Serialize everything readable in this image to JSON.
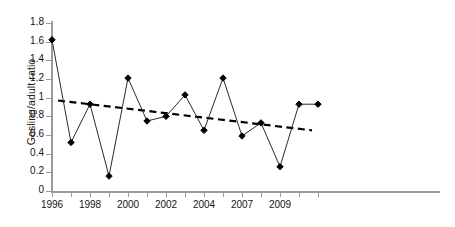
{
  "chart_data": {
    "type": "line",
    "title": "",
    "xlabel": "",
    "ylabel": "Gosling/adult ratio",
    "xlim": [
      1995.5,
      2010.5
    ],
    "ylim": [
      0,
      1.8
    ],
    "grid": false,
    "legend": null,
    "x_tick_labels": [
      "1996",
      "1998",
      "2000",
      "2002",
      "2004",
      "2007",
      "2009"
    ],
    "x_tick_values": [
      1996,
      1998,
      2000,
      2002,
      2004,
      2006,
      2008
    ],
    "y_tick_labels": [
      "0",
      "0.2",
      "0.4",
      "0.6",
      "0.8",
      "1",
      "1.2",
      "1.4",
      "1.6",
      "1.8"
    ],
    "y_tick_values": [
      0,
      0.2,
      0.4,
      0.6,
      0.8,
      1.0,
      1.2,
      1.4,
      1.6,
      1.8
    ],
    "x": [
      1996,
      1997,
      1998,
      1999,
      2000,
      2001,
      2002,
      2003,
      2004,
      2005,
      2006,
      2007,
      2008,
      2009,
      2010
    ],
    "series": [
      {
        "name": "Gosling/adult ratio",
        "marker": "diamond",
        "color": "#000000",
        "linestyle": "solid",
        "values": [
          1.62,
          0.52,
          0.93,
          0.16,
          1.21,
          0.75,
          0.8,
          1.03,
          0.65,
          1.21,
          0.59,
          0.73,
          0.26,
          0.93,
          0.93
        ]
      },
      {
        "name": "linear trend",
        "marker": "none",
        "color": "#000000",
        "linestyle": "dashed",
        "trend_start": 0.97,
        "trend_end": 0.65,
        "values": [
          0.97,
          0.95,
          0.93,
          0.9,
          0.88,
          0.86,
          0.84,
          0.82,
          0.79,
          0.77,
          0.75,
          0.73,
          0.7,
          0.68,
          0.65
        ]
      }
    ]
  },
  "axes": {
    "y_title": "Gosling/adult ratio"
  },
  "caption": {
    "cropped_text": ""
  }
}
